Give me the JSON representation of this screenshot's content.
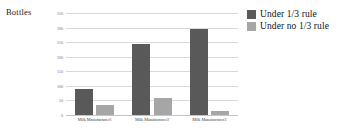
{
  "axis_title": "Bottles",
  "legend": {
    "position": "right-top",
    "entries": [
      {
        "label": "Under 1/3 rule",
        "color": "#595959",
        "swatch": "legend-swatch-dark"
      },
      {
        "label": "Under no 1/3 rule",
        "color": "#a6a6a6",
        "swatch": "legend-swatch-light"
      }
    ]
  },
  "chart_data": {
    "type": "bar",
    "title": "",
    "xlabel": "",
    "ylabel": "Bottles",
    "ylim": [
      0,
      350
    ],
    "yticks": [
      0,
      50,
      100,
      150,
      200,
      250,
      300,
      350
    ],
    "ytick_labels": [
      "0",
      "50",
      "100",
      "150",
      "200",
      "250",
      "300",
      "350"
    ],
    "grid": true,
    "categories": [
      "Milk Manufacturer1",
      "Milk Manufacturer2",
      "Milk Manufacturer3"
    ],
    "series": [
      {
        "name": "Under 1/3 rule",
        "color": "#595959",
        "values": [
          90,
          245,
          295
        ]
      },
      {
        "name": "Under no 1/3 rule",
        "color": "#a6a6a6",
        "values": [
          35,
          60,
          15
        ]
      }
    ]
  }
}
